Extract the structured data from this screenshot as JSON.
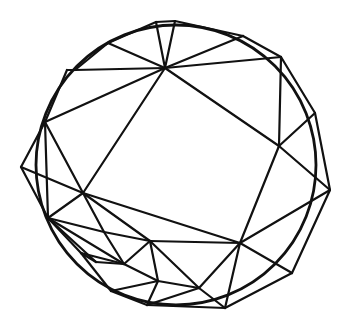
{
  "diagram": {
    "type": "triangulated-circle-mesh",
    "stroke_color": "#111111",
    "background": "#ffffff",
    "circle": {
      "cx": 176,
      "cy": 165,
      "r": 140
    },
    "vertices": {
      "P1": [
        156,
        22
      ],
      "P2": [
        175,
        21
      ],
      "P3": [
        108,
        43
      ],
      "P4": [
        67,
        70
      ],
      "P5": [
        75,
        70
      ],
      "P6": [
        45,
        122
      ],
      "P7": [
        21,
        167
      ],
      "P8": [
        48,
        218
      ],
      "P9": [
        81,
        253
      ],
      "P10": [
        111,
        291
      ],
      "P11": [
        147,
        305
      ],
      "P12": [
        225,
        308
      ],
      "P13": [
        292,
        273
      ],
      "P14": [
        330,
        190
      ],
      "P15": [
        315,
        113
      ],
      "P16": [
        281,
        57
      ],
      "P17": [
        243,
        36
      ],
      "A": [
        165,
        68
      ],
      "B": [
        83,
        193
      ],
      "C": [
        240,
        243
      ],
      "D": [
        279,
        146
      ],
      "E": [
        104,
        232
      ],
      "F": [
        96,
        262
      ],
      "G": [
        124,
        264
      ],
      "H": [
        150,
        241
      ],
      "I": [
        158,
        281
      ],
      "J": [
        199,
        288
      ],
      "K": [
        37,
        190
      ],
      "L": [
        62,
        252
      ]
    },
    "edges": [
      [
        "P1",
        "P2"
      ],
      [
        "P2",
        "P17"
      ],
      [
        "P1",
        "P3"
      ],
      [
        "P3",
        "P5"
      ],
      [
        "P4",
        "P5"
      ],
      [
        "P4",
        "P6"
      ],
      [
        "P6",
        "P7"
      ],
      [
        "P7",
        "P8"
      ],
      [
        "P8",
        "P9"
      ],
      [
        "P9",
        "P10"
      ],
      [
        "P10",
        "P11"
      ],
      [
        "P11",
        "P12"
      ],
      [
        "P12",
        "P13"
      ],
      [
        "P13",
        "P14"
      ],
      [
        "P14",
        "P15"
      ],
      [
        "P15",
        "P16"
      ],
      [
        "P16",
        "P17"
      ],
      [
        "A",
        "P1"
      ],
      [
        "A",
        "P2"
      ],
      [
        "A",
        "P3"
      ],
      [
        "A",
        "P5"
      ],
      [
        "A",
        "P17"
      ],
      [
        "A",
        "P16"
      ],
      [
        "A",
        "B"
      ],
      [
        "A",
        "P6"
      ],
      [
        "A",
        "D"
      ],
      [
        "P16",
        "D"
      ],
      [
        "D",
        "P15"
      ],
      [
        "D",
        "P14"
      ],
      [
        "D",
        "C"
      ],
      [
        "B",
        "P6"
      ],
      [
        "B",
        "P7"
      ],
      [
        "B",
        "P8"
      ],
      [
        "B",
        "C"
      ],
      [
        "B",
        "E"
      ],
      [
        "B",
        "H"
      ],
      [
        "P6",
        "P8"
      ],
      [
        "C",
        "P14"
      ],
      [
        "C",
        "P13"
      ],
      [
        "C",
        "P12"
      ],
      [
        "C",
        "J"
      ],
      [
        "C",
        "H"
      ],
      [
        "P8",
        "E"
      ],
      [
        "P8",
        "F"
      ],
      [
        "P8",
        "G"
      ],
      [
        "E",
        "H"
      ],
      [
        "E",
        "G"
      ],
      [
        "F",
        "G"
      ],
      [
        "F",
        "P9"
      ],
      [
        "G",
        "H"
      ],
      [
        "G",
        "I"
      ],
      [
        "H",
        "I"
      ],
      [
        "H",
        "J"
      ],
      [
        "I",
        "J"
      ],
      [
        "I",
        "P10"
      ],
      [
        "I",
        "P11"
      ],
      [
        "J",
        "P12"
      ],
      [
        "P9",
        "G"
      ],
      [
        "J",
        "P11"
      ]
    ]
  }
}
